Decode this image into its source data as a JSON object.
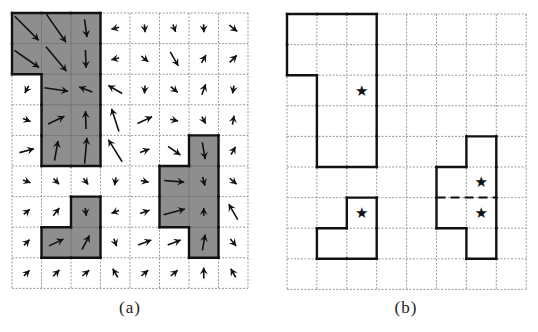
{
  "figure": {
    "panels": [
      {
        "id": "a",
        "caption": "(a)",
        "description": "Vector field over grid with shaded regions",
        "grid": {
          "cols": 8,
          "rows": 9,
          "x0": 12,
          "y0": 13,
          "cell_w": 29.5,
          "cell_h": 30.6
        },
        "fill_color": "#8e8e8e",
        "regions": [
          {
            "name": "region-1",
            "cells": [
              [
                0,
                0
              ],
              [
                1,
                0
              ],
              [
                2,
                0
              ],
              [
                0,
                1
              ],
              [
                1,
                1
              ],
              [
                2,
                1
              ],
              [
                1,
                2
              ],
              [
                2,
                2
              ],
              [
                1,
                3
              ],
              [
                2,
                3
              ],
              [
                1,
                4
              ],
              [
                2,
                4
              ]
            ]
          },
          {
            "name": "region-2",
            "cells": [
              [
                2,
                6
              ],
              [
                1,
                7
              ],
              [
                2,
                7
              ]
            ]
          },
          {
            "name": "region-3",
            "cells": [
              [
                6,
                4
              ],
              [
                5,
                5
              ],
              [
                6,
                5
              ],
              [
                5,
                6
              ],
              [
                6,
                6
              ],
              [
                6,
                7
              ]
            ]
          }
        ],
        "arrows": [
          [
            [
              45,
              34
            ],
            [
              55,
              34
            ],
            [
              82,
              18
            ],
            [
              165,
              8
            ],
            [
              85,
              8
            ],
            [
              70,
              8
            ],
            [
              88,
              8
            ],
            [
              38,
              10
            ]
          ],
          [
            [
              35,
              30
            ],
            [
              50,
              32
            ],
            [
              88,
              18
            ],
            [
              168,
              8
            ],
            [
              40,
              9
            ],
            [
              60,
              16
            ],
            [
              -60,
              9
            ],
            [
              -45,
              10
            ]
          ],
          [
            [
              118,
              8
            ],
            [
              8,
              24
            ],
            [
              200,
              14
            ],
            [
              -150,
              16
            ],
            [
              95,
              8
            ],
            [
              40,
              9
            ],
            [
              -70,
              11
            ],
            [
              100,
              8
            ]
          ],
          [
            [
              22,
              8
            ],
            [
              -25,
              18
            ],
            [
              -92,
              18
            ],
            [
              -108,
              24
            ],
            [
              -25,
              16
            ],
            [
              12,
              8
            ],
            [
              62,
              8
            ],
            [
              -80,
              9
            ]
          ],
          [
            [
              -15,
              15
            ],
            [
              -80,
              20
            ],
            [
              -85,
              26
            ],
            [
              -122,
              26
            ],
            [
              -20,
              10
            ],
            [
              35,
              15
            ],
            [
              80,
              17
            ],
            [
              -60,
              9
            ]
          ],
          [
            [
              20,
              8
            ],
            [
              45,
              8
            ],
            [
              52,
              8
            ],
            [
              100,
              8
            ],
            [
              12,
              8
            ],
            [
              5,
              20
            ],
            [
              75,
              9
            ],
            [
              40,
              9
            ]
          ],
          [
            [
              -40,
              8
            ],
            [
              -52,
              10
            ],
            [
              82,
              8
            ],
            [
              160,
              8
            ],
            [
              -20,
              10
            ],
            [
              -15,
              22
            ],
            [
              -90,
              8
            ],
            [
              -120,
              18
            ]
          ],
          [
            [
              -45,
              8
            ],
            [
              -25,
              16
            ],
            [
              -62,
              16
            ],
            [
              70,
              8
            ],
            [
              -20,
              14
            ],
            [
              -20,
              14
            ],
            [
              -80,
              16
            ],
            [
              50,
              9
            ]
          ],
          [
            [
              -45,
              8
            ],
            [
              -45,
              9
            ],
            [
              -40,
              9
            ],
            [
              -120,
              10
            ],
            [
              -40,
              9
            ],
            [
              -40,
              9
            ],
            [
              -90,
              11
            ],
            [
              -120,
              10
            ]
          ]
        ]
      },
      {
        "id": "b",
        "caption": "(b)",
        "description": "Region outlines with centroid markers",
        "grid": {
          "cols": 8,
          "rows": 9,
          "x0": 287,
          "y0": 14,
          "cell_w": 29.9,
          "cell_h": 30.6
        },
        "regions": [
          {
            "name": "region-1",
            "cells": [
              [
                0,
                0
              ],
              [
                1,
                0
              ],
              [
                2,
                0
              ],
              [
                0,
                1
              ],
              [
                1,
                1
              ],
              [
                2,
                1
              ],
              [
                1,
                2
              ],
              [
                2,
                2
              ],
              [
                1,
                3
              ],
              [
                2,
                3
              ],
              [
                1,
                4
              ],
              [
                2,
                4
              ]
            ]
          },
          {
            "name": "region-2",
            "cells": [
              [
                2,
                6
              ],
              [
                1,
                7
              ],
              [
                2,
                7
              ]
            ]
          },
          {
            "name": "region-3",
            "cells": [
              [
                6,
                4
              ],
              [
                5,
                5
              ],
              [
                6,
                5
              ],
              [
                5,
                6
              ],
              [
                6,
                6
              ],
              [
                6,
                7
              ]
            ]
          }
        ],
        "dashed_divider": {
          "row_boundary": 6,
          "from_col": 5,
          "to_col": 7
        },
        "markers": [
          {
            "symbol": "★",
            "col": 2,
            "row": 2
          },
          {
            "symbol": "★",
            "col": 2,
            "row": 6
          },
          {
            "symbol": "★",
            "col": 6,
            "row": 5
          },
          {
            "symbol": "★",
            "col": 6,
            "row": 6
          }
        ]
      }
    ]
  }
}
